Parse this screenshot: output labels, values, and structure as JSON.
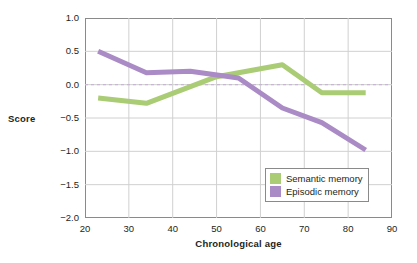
{
  "chart_data": {
    "type": "line",
    "title": "",
    "subtitle": "",
    "xlabel": "Chronological age",
    "ylabel": "Score",
    "xlim": [
      20,
      90
    ],
    "ylim": [
      -2.0,
      1.0
    ],
    "xticks": [
      20,
      30,
      40,
      50,
      60,
      70,
      80,
      90
    ],
    "yticks": [
      1.0,
      0.5,
      0.0,
      -0.5,
      -1.0,
      -1.5,
      -2.0
    ],
    "xtick_labels": [
      "20",
      "30",
      "40",
      "50",
      "60",
      "70",
      "80",
      "90"
    ],
    "ytick_labels": [
      "1.0",
      "0.5",
      "0.0",
      "−0.5",
      "−1.0",
      "−1.5",
      "−2.0"
    ],
    "grid": true,
    "grid_color": "#d0d0d0",
    "zero_line": {
      "value": 0.0,
      "style": "dashed",
      "color": "#c9b6d4"
    },
    "legend_position": "lower right",
    "series": [
      {
        "name": "Semantic memory",
        "color": "#a9cc74",
        "x": [
          23,
          34,
          50,
          65,
          74,
          84
        ],
        "y": [
          -0.2,
          -0.28,
          0.12,
          0.3,
          -0.12,
          -0.12
        ]
      },
      {
        "name": "Episodic memory",
        "color": "#ab8bc5",
        "x": [
          23,
          34,
          44,
          55,
          65,
          74,
          84
        ],
        "y": [
          0.5,
          0.18,
          0.2,
          0.1,
          -0.35,
          -0.57,
          -0.98
        ]
      }
    ]
  },
  "legend": {
    "items": [
      {
        "label": "Semantic memory",
        "color": "#a9cc74"
      },
      {
        "label": "Episodic memory",
        "color": "#ab8bc5"
      }
    ]
  },
  "axes": {
    "y_title": "Score",
    "x_title": "Chronological age"
  }
}
